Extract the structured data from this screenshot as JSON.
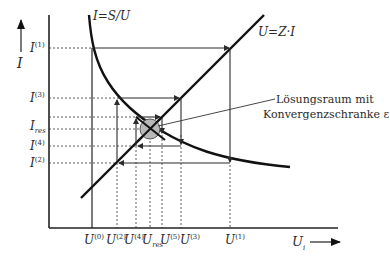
{
  "diagram": {
    "type": "iteration-diagram",
    "y_axis_label": "I",
    "x_axis_label": "U",
    "x_axis_label_sub": "i",
    "curves": [
      {
        "name": "hyperbola",
        "label": "I=S/U"
      },
      {
        "name": "line",
        "label": "U=Z·I"
      }
    ],
    "y_ticks": [
      {
        "base": "I",
        "sup": "(1)",
        "sub": ""
      },
      {
        "base": "I",
        "sup": "(3)",
        "sub": ""
      },
      {
        "base": "I",
        "sup": "",
        "sub": "res"
      },
      {
        "base": "I",
        "sup": "(4)",
        "sub": ""
      },
      {
        "base": "I",
        "sup": "(2)",
        "sub": ""
      }
    ],
    "x_ticks": [
      {
        "base": "U",
        "sup": "(0)",
        "sub": ""
      },
      {
        "base": "U",
        "sup": "(2)",
        "sub": "i"
      },
      {
        "base": "U",
        "sup": "(4)",
        "sub": "i"
      },
      {
        "base": "U",
        "sup": "",
        "sub": "res"
      },
      {
        "base": "U",
        "sup": "(5)",
        "sub": "i"
      },
      {
        "base": "U",
        "sup": "(3)",
        "sub": "i"
      },
      {
        "base": "U",
        "sup": "(1)",
        "sub": "i"
      }
    ],
    "annotation": {
      "line1": "Lösungsraum mit",
      "line2": "Konvergenzschranke ε"
    }
  }
}
